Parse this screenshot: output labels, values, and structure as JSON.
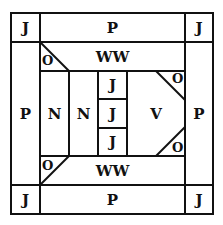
{
  "diagram": {
    "corners": {
      "top_left": "J",
      "top_right": "J",
      "bottom_left": "J",
      "bottom_right": "J"
    },
    "top_band": "P",
    "bottom_band": "P",
    "left_band": "P",
    "right_band": "P",
    "inner_top": "WW",
    "inner_bottom": "WW",
    "inner_left_1": "N",
    "inner_left_2": "N",
    "center_column": [
      "J",
      "J",
      "J"
    ],
    "right_panel": "V",
    "triangles": {
      "top_left": "O",
      "top_right": "O",
      "bottom_left": "O",
      "bottom_right": "O"
    },
    "line_color": "#111111"
  }
}
